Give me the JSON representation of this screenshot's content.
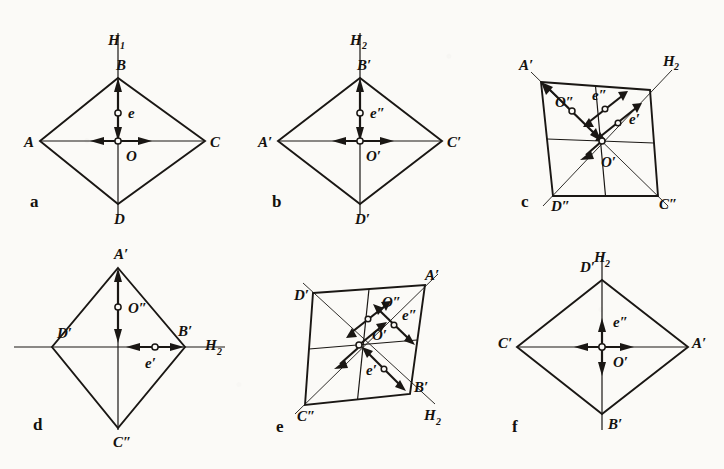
{
  "figure": {
    "caption_style": "engineering-drawing-plate",
    "background_color": "#fbfaf7",
    "ink_color": "#1a1714",
    "panel_count": 6
  },
  "panels": [
    {
      "id": "a",
      "letter": "a",
      "shape": "rhombus-horizontal",
      "axis_label": "H",
      "axis_sub": "1",
      "axis_orientation": "vertical",
      "vertices": [
        {
          "name": "A",
          "label": "A",
          "pos": "left"
        },
        {
          "name": "B",
          "label": "B",
          "pos": "top"
        },
        {
          "name": "C",
          "label": "C",
          "pos": "right"
        },
        {
          "name": "D",
          "label": "D",
          "pos": "bottom"
        }
      ],
      "markers": [
        {
          "name": "e",
          "label": "e",
          "direction": "vertical"
        },
        {
          "name": "O",
          "label": "O",
          "direction": "horizontal"
        }
      ]
    },
    {
      "id": "b",
      "letter": "b",
      "shape": "rhombus-horizontal",
      "axis_label": "H",
      "axis_sub": "2",
      "axis_orientation": "vertical",
      "vertices": [
        {
          "name": "A-prime",
          "label": "A′",
          "pos": "left"
        },
        {
          "name": "B-prime",
          "label": "B′",
          "pos": "top"
        },
        {
          "name": "C-prime",
          "label": "C′",
          "pos": "right"
        },
        {
          "name": "D-prime",
          "label": "D′",
          "pos": "bottom"
        }
      ],
      "markers": [
        {
          "name": "e-double-prime",
          "label": "e″",
          "direction": "vertical"
        },
        {
          "name": "O-prime",
          "label": "O′",
          "direction": "horizontal"
        }
      ]
    },
    {
      "id": "c",
      "letter": "c",
      "shape": "skew-quad",
      "axis_label": "H",
      "axis_sub": "2",
      "axis_orientation": "diagonal",
      "vertices": [
        {
          "name": "A-prime",
          "label": "A′",
          "pos": "top-left"
        },
        {
          "name": "D-double-prime",
          "label": "D″",
          "pos": "bottom-left"
        },
        {
          "name": "C-double-prime",
          "label": "C″",
          "pos": "bottom-right"
        }
      ],
      "markers": [
        {
          "name": "O-double-prime",
          "label": "O″",
          "direction": "diagonal-nwse"
        },
        {
          "name": "e-double-prime",
          "label": "e″",
          "direction": "diagonal-nesw"
        },
        {
          "name": "e-prime",
          "label": "e′",
          "direction": "diagonal-nesw"
        },
        {
          "name": "O-prime",
          "label": "O′",
          "direction": "center"
        }
      ]
    },
    {
      "id": "d",
      "letter": "d",
      "shape": "rhombus-vertical",
      "axis_label": "H",
      "axis_sub": "2",
      "axis_orientation": "horizontal",
      "vertices": [
        {
          "name": "A-prime",
          "label": "A′",
          "pos": "top"
        },
        {
          "name": "D-prime",
          "label": "D′",
          "pos": "left"
        },
        {
          "name": "B-prime",
          "label": "B′",
          "pos": "right"
        },
        {
          "name": "C-double-prime",
          "label": "C″",
          "pos": "bottom"
        }
      ],
      "markers": [
        {
          "name": "O-double-prime",
          "label": "O″",
          "direction": "vertical"
        },
        {
          "name": "e-prime",
          "label": "e′",
          "direction": "horizontal"
        }
      ]
    },
    {
      "id": "e",
      "letter": "e",
      "shape": "skew-quad",
      "axis_label": "H",
      "axis_sub": "2",
      "axis_orientation": "diagonal",
      "vertices": [
        {
          "name": "D-prime",
          "label": "D′",
          "pos": "top-left"
        },
        {
          "name": "A-prime",
          "label": "A′",
          "pos": "top-right"
        },
        {
          "name": "C-double-prime",
          "label": "C″",
          "pos": "bottom-left"
        },
        {
          "name": "B-prime",
          "label": "B′",
          "pos": "bottom-right"
        }
      ],
      "markers": [
        {
          "name": "O-double-prime",
          "label": "O″",
          "direction": "diagonal-swne"
        },
        {
          "name": "e-double-prime",
          "label": "e″",
          "direction": "diagonal-nwse"
        },
        {
          "name": "O-prime",
          "label": "O′",
          "direction": "center"
        },
        {
          "name": "e-prime",
          "label": "e′",
          "direction": "diagonal-nwse"
        }
      ]
    },
    {
      "id": "f",
      "letter": "f",
      "shape": "rhombus-horizontal",
      "axis_label": "H",
      "axis_sub": "2",
      "axis_orientation": "vertical",
      "vertices": [
        {
          "name": "D-prime",
          "label": "D′",
          "pos": "top"
        },
        {
          "name": "C-prime",
          "label": "C′",
          "pos": "left"
        },
        {
          "name": "A-prime",
          "label": "A′",
          "pos": "right"
        },
        {
          "name": "B-prime",
          "label": "B′",
          "pos": "bottom"
        }
      ],
      "markers": [
        {
          "name": "e-double-prime",
          "label": "e″",
          "direction": "vertical"
        },
        {
          "name": "O-prime",
          "label": "O′",
          "direction": "horizontal"
        }
      ]
    }
  ],
  "labels": {
    "a": {
      "letter": "a",
      "A": "A",
      "B": "B",
      "C": "C",
      "D": "D",
      "e": "e",
      "O": "O",
      "H": "H",
      "Hsub": "1"
    },
    "b": {
      "letter": "b",
      "A": "A′",
      "B": "B′",
      "C": "C′",
      "D": "D′",
      "e": "e″",
      "O": "O′",
      "H": "H",
      "Hsub": "2"
    },
    "c": {
      "letter": "c",
      "A": "A′",
      "D": "D″",
      "C": "C″",
      "Odd": "O″",
      "edd": "e″",
      "ed": "e′",
      "Od": "O′",
      "H": "H",
      "Hsub": "2"
    },
    "d": {
      "letter": "d",
      "A": "A′",
      "D": "D′",
      "B": "B′",
      "C": "C″",
      "Odd": "O″",
      "ed": "e′",
      "H": "H",
      "Hsub": "2"
    },
    "e": {
      "letter": "e",
      "D": "D′",
      "A": "A′",
      "C": "C″",
      "B": "B′",
      "Odd": "O″",
      "edd": "e″",
      "Od": "O′",
      "ed": "e′",
      "H": "H",
      "Hsub": "2"
    },
    "f": {
      "letter": "f",
      "D": "D′",
      "C": "C′",
      "A": "A′",
      "B": "B′",
      "e": "e″",
      "O": "O′",
      "H": "H",
      "Hsub": "2"
    }
  }
}
